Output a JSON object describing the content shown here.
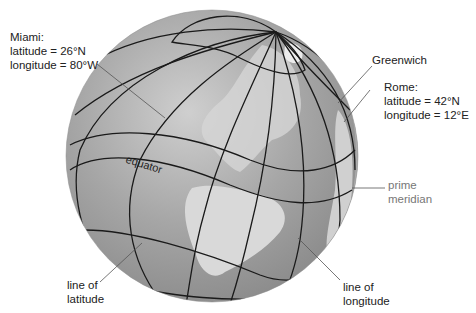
{
  "colors": {
    "background": "#ffffff",
    "ocean": "#9d9d9d",
    "ocean_highlight": "#c8c8c8",
    "land": "#d4d4d4",
    "grid_lines": "#1a1a1a",
    "leader_lines": "#555555",
    "label_text": "#222222",
    "prime_meridian_label": "#777777"
  },
  "labels": {
    "miami": {
      "name": "Miami:",
      "latitude": "latitude = 26°N",
      "longitude": "longitude = 80°W"
    },
    "greenwich": "Greenwich",
    "rome": {
      "name": "Rome:",
      "latitude": "latitude = 42°N",
      "longitude": "longitude = 12°E"
    },
    "prime_meridian": {
      "line1": "prime",
      "line2": "meridian"
    },
    "equator": "equator",
    "line_of_latitude": {
      "line1": "line of",
      "line2": "latitude"
    },
    "line_of_longitude": {
      "line1": "line of",
      "line2": "longitude"
    }
  }
}
